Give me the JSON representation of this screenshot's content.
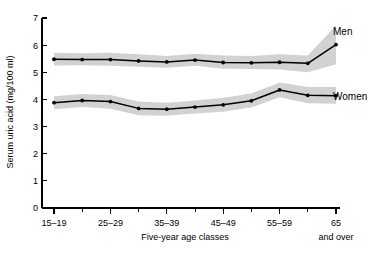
{
  "chart_data": {
    "type": "line",
    "title": "",
    "xlabel": "Five-year age classes",
    "ylabel": "Serum uric acid (mg/100 ml)",
    "ylim": [
      0,
      7
    ],
    "yticks": [
      0,
      1,
      2,
      3,
      4,
      5,
      6,
      7
    ],
    "ytick_labels": [
      "0",
      "1",
      "2",
      "3",
      "4",
      "5",
      "6",
      "7"
    ],
    "grid": false,
    "legend_position": "right-inline",
    "categories": [
      "15-19",
      "20-24",
      "25-29",
      "30-34",
      "35-39",
      "40-44",
      "45-49",
      "50-54",
      "55-59",
      "60-64",
      "65 and over"
    ],
    "xtick_labels": [
      "15–19",
      "25–29",
      "35–39",
      "45–49",
      "55–59",
      "65"
    ],
    "xtick_label_sub": "and over",
    "xtick_label_indices": [
      0,
      2,
      4,
      6,
      8,
      10
    ],
    "series": [
      {
        "name": "Men",
        "label": "Men",
        "values": [
          5.48,
          5.47,
          5.47,
          5.42,
          5.38,
          5.45,
          5.36,
          5.35,
          5.37,
          5.33,
          6.02
        ],
        "band_upper": [
          5.72,
          5.7,
          5.72,
          5.66,
          5.6,
          5.68,
          5.62,
          5.6,
          5.66,
          5.62,
          6.72
        ],
        "band_lower": [
          5.25,
          5.26,
          5.24,
          5.2,
          5.17,
          5.24,
          5.13,
          5.12,
          5.1,
          5.0,
          5.3
        ]
      },
      {
        "name": "Women",
        "label": "Women",
        "values": [
          3.88,
          3.96,
          3.92,
          3.67,
          3.64,
          3.72,
          3.8,
          3.95,
          4.35,
          4.15,
          4.14
        ],
        "band_upper": [
          4.12,
          4.2,
          4.16,
          3.92,
          3.88,
          3.96,
          4.06,
          4.22,
          4.62,
          4.46,
          4.46
        ],
        "band_lower": [
          3.64,
          3.72,
          3.66,
          3.42,
          3.4,
          3.48,
          3.55,
          3.7,
          4.08,
          3.86,
          3.84
        ]
      }
    ],
    "series_colors": {
      "line": "#000000",
      "band": "#b7b7b7"
    }
  },
  "labels": {
    "y_axis_title": "Serum uric acid (mg/100 ml)",
    "x_axis_title": "Five-year age classes",
    "men": "Men",
    "women": "Women",
    "and_over": "and over"
  }
}
